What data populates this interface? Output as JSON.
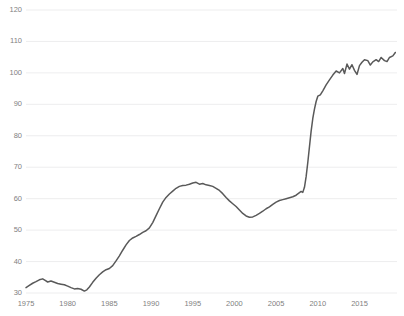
{
  "chart_data": {
    "type": "line",
    "title": "",
    "subtitle": "",
    "xlabel": "",
    "ylabel": "",
    "xlim": [
      1975,
      2019.5
    ],
    "ylim": [
      30,
      120
    ],
    "grid": "horizontal",
    "legend": "none",
    "line_color": "#595959",
    "grid_color": "#e8e8ea",
    "tick_label_color": "#7f7f7f",
    "background_color": "#ffffff",
    "ytick_labels": [
      "120",
      "110",
      "100",
      "90",
      "80",
      "70",
      "60",
      "50",
      "40",
      "30"
    ],
    "ytick_values": [
      120,
      110,
      100,
      90,
      80,
      70,
      60,
      50,
      40,
      30
    ],
    "xtick_labels": [
      "1975",
      "1980",
      "1985",
      "1990",
      "1995",
      "2000",
      "2005",
      "2010",
      "2015"
    ],
    "xtick_values": [
      1975,
      1980,
      1985,
      1990,
      1995,
      2000,
      2005,
      2010,
      2015
    ],
    "series": [
      {
        "name": "series-1",
        "x": [
          1975.0,
          1975.4,
          1975.8,
          1976.2,
          1976.6,
          1977.0,
          1977.3,
          1977.6,
          1978.0,
          1978.4,
          1978.8,
          1979.2,
          1979.6,
          1980.0,
          1980.4,
          1980.8,
          1981.2,
          1981.6,
          1982.0,
          1982.3,
          1982.6,
          1983.0,
          1983.4,
          1983.8,
          1984.2,
          1984.6,
          1985.0,
          1985.4,
          1985.8,
          1986.2,
          1986.6,
          1987.0,
          1987.4,
          1987.8,
          1988.2,
          1988.6,
          1989.0,
          1989.4,
          1989.8,
          1990.2,
          1990.6,
          1991.0,
          1991.4,
          1991.8,
          1992.2,
          1992.6,
          1993.0,
          1993.4,
          1993.8,
          1994.2,
          1994.6,
          1995.0,
          1995.4,
          1995.8,
          1996.2,
          1996.6,
          1997.0,
          1997.4,
          1997.8,
          1998.2,
          1998.6,
          1999.0,
          1999.4,
          1999.8,
          2000.2,
          2000.6,
          2001.0,
          2001.4,
          2001.8,
          2002.2,
          2002.6,
          2003.0,
          2003.4,
          2003.8,
          2004.2,
          2004.6,
          2005.0,
          2005.4,
          2005.8,
          2006.2,
          2006.6,
          2007.0,
          2007.4,
          2007.8,
          2008.0,
          2008.2,
          2008.4,
          2008.6,
          2008.8,
          2009.0,
          2009.2,
          2009.4,
          2009.6,
          2009.8,
          2010.0,
          2010.3,
          2010.6,
          2011.0,
          2011.4,
          2011.8,
          2012.2,
          2012.6,
          2013.0,
          2013.2,
          2013.5,
          2013.8,
          2014.1,
          2014.4,
          2014.7,
          2015.0,
          2015.3,
          2015.6,
          2016.0,
          2016.3,
          2016.6,
          2017.0,
          2017.3,
          2017.6,
          2018.0,
          2018.3,
          2018.6,
          2019.0,
          2019.3
        ],
        "y": [
          31.7,
          32.4,
          33.1,
          33.6,
          34.2,
          34.5,
          34.0,
          33.5,
          33.8,
          33.4,
          33.0,
          32.8,
          32.6,
          32.2,
          31.7,
          31.3,
          31.4,
          31.2,
          30.6,
          31.0,
          31.9,
          33.4,
          34.7,
          35.8,
          36.7,
          37.4,
          37.8,
          38.7,
          40.2,
          41.8,
          43.6,
          45.3,
          46.7,
          47.5,
          48.0,
          48.6,
          49.3,
          49.8,
          50.7,
          52.4,
          54.6,
          56.8,
          58.9,
          60.4,
          61.5,
          62.4,
          63.3,
          63.9,
          64.2,
          64.3,
          64.6,
          65.0,
          65.2,
          64.6,
          64.8,
          64.4,
          64.2,
          63.9,
          63.3,
          62.6,
          61.6,
          60.4,
          59.3,
          58.4,
          57.5,
          56.4,
          55.3,
          54.5,
          54.1,
          54.2,
          54.7,
          55.3,
          56.0,
          56.8,
          57.4,
          58.2,
          58.9,
          59.4,
          59.7,
          60.0,
          60.3,
          60.6,
          61.1,
          61.9,
          62.3,
          62.0,
          63.6,
          67.0,
          71.5,
          76.5,
          81.5,
          85.5,
          88.5,
          90.9,
          92.6,
          93.0,
          94.3,
          96.2,
          97.8,
          99.3,
          100.6,
          100.0,
          101.4,
          99.8,
          102.8,
          101.2,
          102.6,
          100.8,
          99.5,
          102.3,
          103.4,
          104.2,
          103.9,
          102.5,
          103.5,
          104.2,
          103.6,
          104.9,
          103.9,
          103.6,
          104.9,
          105.4,
          106.5
        ]
      }
    ]
  }
}
